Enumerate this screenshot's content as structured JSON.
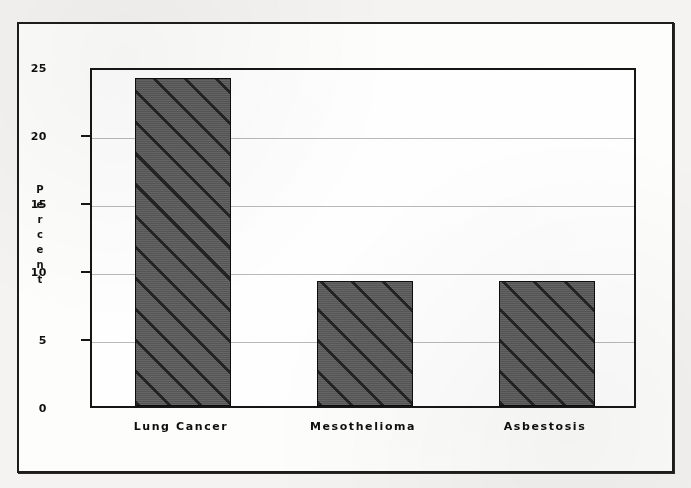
{
  "figure": {
    "frame_color": "#1c1c1c",
    "plot_background": "#fefefe",
    "page_background": "#f4f3f1"
  },
  "chart_data": {
    "type": "bar",
    "title": "",
    "xlabel": "",
    "ylabel": "Percent",
    "ylabel_letters": [
      "P",
      "e",
      "r",
      "c",
      "e",
      "n",
      "t"
    ],
    "categories": [
      "Lung Cancer",
      "Mesothelioma",
      "Asbestosis"
    ],
    "values": [
      24.1,
      9.2,
      9.2
    ],
    "ylim": [
      0,
      25
    ],
    "yticks": [
      0,
      5,
      10,
      15,
      20,
      25
    ],
    "ytick_labels": [
      "0",
      "5",
      "10",
      "15",
      "20",
      "25"
    ],
    "grid": true,
    "legend": null,
    "series_style": {
      "fill_color": "#5a5a5a",
      "hatch": "diagonal-45",
      "edge_color": "#0d0d0d"
    }
  }
}
